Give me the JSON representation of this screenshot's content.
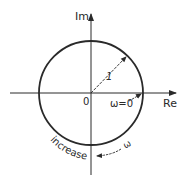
{
  "diagram": {
    "type": "complex-plane-unit-circle",
    "axes": {
      "imag_label": "Im",
      "real_label": "Re",
      "origin_label": "0"
    },
    "circle": {
      "radius_label": "1"
    },
    "annotations": {
      "start_point_label": "ω=0",
      "direction_label": "increase",
      "frequency_symbol": "ω"
    },
    "colors": {
      "stroke": "#2a2a2a",
      "background": "#ffffff"
    }
  }
}
